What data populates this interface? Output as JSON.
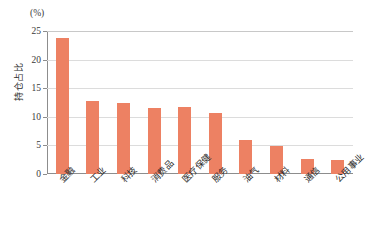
{
  "chart_data": {
    "type": "bar",
    "title": "",
    "subtitle": "",
    "xlabel": "",
    "ylabel": "持仓占比",
    "unit_label": "(%)",
    "ylim": [
      0,
      25
    ],
    "yticks": [
      0,
      5,
      10,
      15,
      20,
      25
    ],
    "ytick_labels": [
      "0",
      "5",
      "10",
      "15",
      "20",
      "25"
    ],
    "grid": true,
    "legend": null,
    "bar_color": "#ED8163",
    "gridline_color": "#DCDCDC",
    "axis_color": "#8D8D8D",
    "categories": [
      "金融",
      "工业",
      "科技",
      "消费品",
      "医疗保健",
      "服务",
      "油气",
      "材料",
      "通信",
      "公用事业"
    ],
    "values": [
      23.8,
      12.7,
      12.4,
      11.6,
      11.7,
      10.6,
      6.0,
      4.9,
      2.6,
      2.5
    ]
  }
}
